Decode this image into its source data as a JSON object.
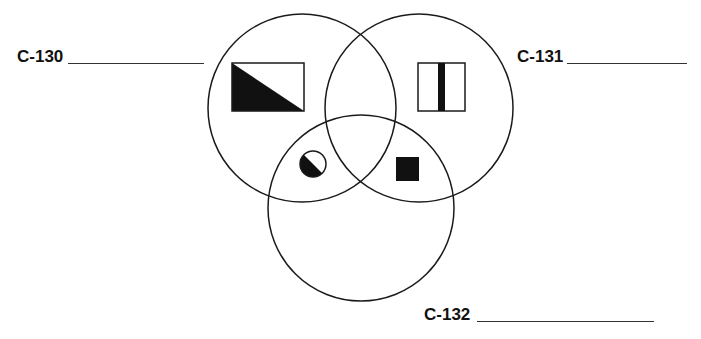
{
  "diagram": {
    "type": "venn",
    "colors": {
      "stroke": "#1a1a1a",
      "fill": "#111111",
      "background": "#ffffff"
    },
    "sets": [
      {
        "id": "C-130",
        "label": "C-130",
        "answer_blank": "",
        "circle": {
          "cx": 302,
          "cy": 108,
          "r": 94
        }
      },
      {
        "id": "C-131",
        "label": "C-131",
        "answer_blank": "",
        "circle": {
          "cx": 419,
          "cy": 108,
          "r": 94
        }
      },
      {
        "id": "C-132",
        "label": "C-132",
        "answer_blank": "",
        "circle": {
          "cx": 361,
          "cy": 208,
          "r": 93
        }
      }
    ],
    "symbols": [
      {
        "name": "diagonal-half-filled-rectangle",
        "region": "C-130 only"
      },
      {
        "name": "vertical-bar-square",
        "region": "C-131 only"
      },
      {
        "name": "diagonal-half-filled-circle",
        "region": "C-130 ∩ C-132"
      },
      {
        "name": "filled-square",
        "region": "C-131 ∩ C-132"
      }
    ]
  }
}
